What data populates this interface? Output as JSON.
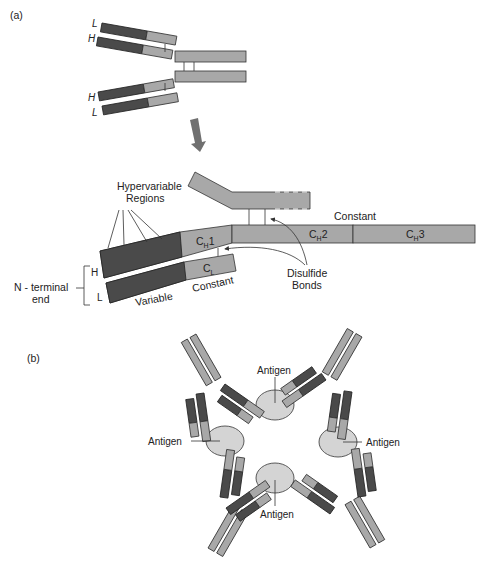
{
  "panel_a": {
    "label": "(a)",
    "top_diagram": {
      "chain_labels": [
        "L",
        "H",
        "H",
        "L"
      ]
    },
    "detail": {
      "hypervariable": [
        "Hypervariable",
        "Regions"
      ],
      "n_terminal": [
        "N - terminal",
        "end"
      ],
      "h_label": "H",
      "l_label": "L",
      "ch1": {
        "main": "C",
        "sub": "H",
        "suffix": "1"
      },
      "cl": {
        "main": "C",
        "sub": "L"
      },
      "ch2": {
        "main": "C",
        "sub": "H",
        "suffix": "2"
      },
      "ch3": {
        "main": "C",
        "sub": "H",
        "suffix": "3"
      },
      "constant_top": "Constant",
      "constant_bottom": "Constant",
      "variable": "Variable",
      "disulfide": [
        "Disulfide",
        "Bonds"
      ]
    }
  },
  "panel_b": {
    "label": "(b)",
    "antigens": [
      "Antigen",
      "Antigen",
      "Antigen",
      "Antigen"
    ]
  },
  "colors": {
    "variable": "#4a4a4a",
    "constant": "#a8a8a8",
    "antigen": "#d4d4d4"
  }
}
